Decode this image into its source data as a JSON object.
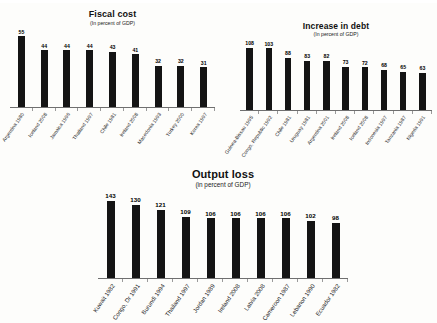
{
  "page": {
    "background_color": "#fdfdfb",
    "bar_color": "#141414",
    "axis_color": "#6f6f6f"
  },
  "chart_data": [
    {
      "type": "bar",
      "title": "Fiscal cost",
      "subtitle": "(In percent of GDP)",
      "xlabel": "",
      "ylabel": "",
      "ylim": [
        0,
        60
      ],
      "grid": false,
      "legend": "none",
      "categories": [
        "Argentina 1980",
        "Iceland 2008",
        "Jamaica 1996",
        "Thailand 1997",
        "Chile 1981",
        "Ireland 2008",
        "Macedonia 1993",
        "Turkey 2000",
        "Korea 1997"
      ],
      "values": [
        55,
        44,
        44,
        44,
        43,
        41,
        32,
        32,
        31
      ]
    },
    {
      "type": "bar",
      "title": "Increase in debt",
      "subtitle": "(In percent of GDP)",
      "xlabel": "",
      "ylabel": "",
      "ylim": [
        0,
        115
      ],
      "grid": false,
      "legend": "none",
      "categories": [
        "Guinea-Bissau 1995",
        "Congo, Republic 1992",
        "Chile 1981",
        "Uruguay 1981",
        "Argentina 2001",
        "Ireland 2008",
        "Iceland 2008",
        "Indonesia 1997",
        "Tanzania 1987",
        "Nigeria 1991"
      ],
      "values": [
        108,
        103,
        88,
        83,
        82,
        73,
        72,
        68,
        65,
        63
      ]
    },
    {
      "type": "bar",
      "title": "Output loss",
      "subtitle": "(in percent of GDP)",
      "xlabel": "",
      "ylabel": "",
      "ylim": [
        0,
        150
      ],
      "grid": false,
      "legend": "none",
      "categories": [
        "Kuwait 1982",
        "Congo, Dr 1991",
        "Burundi 1994",
        "Thailand 1997",
        "Jordan 1989",
        "Ireland 2008",
        "Latvia 2008",
        "Cameroon 1987",
        "Lebanon 1990",
        "Ecuador 1982"
      ],
      "values": [
        143,
        130,
        121,
        109,
        106,
        106,
        106,
        106,
        102,
        98
      ]
    }
  ]
}
